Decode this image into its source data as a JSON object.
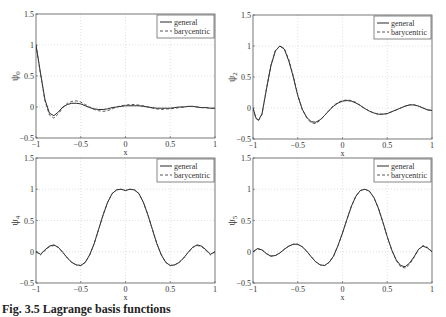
{
  "caption": "Fig. 3.5 Lagrange basis functions",
  "colors": {
    "general": "#111111",
    "barycentric": "#444444",
    "grid": "#cccccc",
    "axes": "#555555"
  },
  "chart_data": [
    {
      "type": "line",
      "id": "psi0",
      "ylabel": "ψ0",
      "ylabel_base": "ψ",
      "ylabel_sub": "0",
      "xlabel": "x",
      "xlim": [
        -1,
        1
      ],
      "ylim": [
        -0.5,
        1.5
      ],
      "xticks": [
        -1,
        -0.5,
        0,
        0.5,
        1
      ],
      "xticklabels": [
        "-1",
        "-0.5",
        "0",
        "0.5",
        "1"
      ],
      "yticks": [
        -0.5,
        0,
        0.5,
        1,
        1.5
      ],
      "yticklabels": [
        "-0.5",
        "0",
        "0.5",
        "1",
        "1.5"
      ],
      "grid": true,
      "legend": {
        "position": "top-right",
        "entries": [
          "general",
          "barycentric"
        ]
      },
      "series": [
        {
          "name": "general",
          "style": "solid",
          "x": [
            -1,
            -0.95,
            -0.9,
            -0.85,
            -0.8,
            -0.75,
            -0.7,
            -0.65,
            -0.6,
            -0.55,
            -0.5,
            -0.45,
            -0.4,
            -0.35,
            -0.3,
            -0.25,
            -0.2,
            -0.15,
            -0.1,
            -0.05,
            0,
            0.05,
            0.1,
            0.15,
            0.2,
            0.25,
            0.3,
            0.35,
            0.4,
            0.45,
            0.5,
            0.55,
            0.6,
            0.65,
            0.7,
            0.75,
            0.8,
            0.85,
            0.9,
            0.95,
            1
          ],
          "y": [
            1.0,
            0.55,
            0.12,
            -0.1,
            -0.14,
            -0.08,
            0.0,
            0.04,
            0.06,
            0.06,
            0.05,
            0.02,
            -0.01,
            -0.03,
            -0.04,
            -0.04,
            -0.03,
            -0.01,
            0.0,
            0.01,
            0.02,
            0.02,
            0.02,
            0.02,
            0.01,
            0.0,
            -0.01,
            -0.02,
            -0.02,
            -0.02,
            -0.02,
            -0.01,
            0.0,
            0.0,
            0.01,
            0.01,
            0.0,
            -0.01,
            -0.01,
            -0.02,
            -0.02
          ]
        },
        {
          "name": "barycentric",
          "style": "dashed",
          "x": [
            -1,
            -0.95,
            -0.9,
            -0.85,
            -0.8,
            -0.75,
            -0.7,
            -0.65,
            -0.6,
            -0.55,
            -0.5,
            -0.45,
            -0.4,
            -0.35,
            -0.3,
            -0.25,
            -0.2,
            -0.15,
            -0.1,
            -0.05,
            0,
            0.05,
            0.1,
            0.15,
            0.2,
            0.25,
            0.3,
            0.35,
            0.4,
            0.45,
            0.5,
            0.55,
            0.6,
            0.65,
            0.7,
            0.75,
            0.8,
            0.85,
            0.9,
            0.95,
            1
          ],
          "y": [
            1.0,
            0.53,
            0.1,
            -0.13,
            -0.18,
            -0.11,
            -0.01,
            0.06,
            0.09,
            0.1,
            0.08,
            0.04,
            0.0,
            -0.04,
            -0.06,
            -0.07,
            -0.06,
            -0.03,
            0.0,
            0.02,
            0.03,
            0.04,
            0.04,
            0.03,
            0.02,
            0.0,
            -0.02,
            -0.03,
            -0.04,
            -0.03,
            -0.03,
            -0.02,
            -0.01,
            0.0,
            0.01,
            0.01,
            0.0,
            -0.01,
            -0.01,
            -0.02,
            -0.02
          ]
        }
      ]
    },
    {
      "type": "line",
      "id": "psi2",
      "ylabel": "ψ2",
      "ylabel_base": "ψ",
      "ylabel_sub": "2",
      "xlabel": "x",
      "xlim": [
        -1,
        1
      ],
      "ylim": [
        -0.5,
        1.5
      ],
      "xticks": [
        -1,
        -0.5,
        0,
        0.5,
        1
      ],
      "xticklabels": [
        "-1",
        "-0.5",
        "0",
        "0.5",
        "1"
      ],
      "yticks": [
        -0.5,
        0,
        0.5,
        1,
        1.5
      ],
      "yticklabels": [
        "-0.5",
        "0",
        "0.5",
        "1",
        "1.5"
      ],
      "grid": true,
      "legend": {
        "position": "top-right",
        "entries": [
          "general",
          "barycentric"
        ]
      },
      "series": [
        {
          "name": "general",
          "style": "solid",
          "x": [
            -1,
            -0.97,
            -0.94,
            -0.9,
            -0.85,
            -0.8,
            -0.75,
            -0.7,
            -0.65,
            -0.6,
            -0.55,
            -0.5,
            -0.45,
            -0.4,
            -0.35,
            -0.3,
            -0.25,
            -0.2,
            -0.15,
            -0.1,
            -0.05,
            0,
            0.05,
            0.1,
            0.15,
            0.2,
            0.25,
            0.3,
            0.35,
            0.4,
            0.45,
            0.5,
            0.55,
            0.6,
            0.65,
            0.7,
            0.75,
            0.8,
            0.85,
            0.9,
            0.95,
            1
          ],
          "y": [
            0.0,
            -0.15,
            -0.2,
            -0.1,
            0.3,
            0.68,
            0.92,
            1.0,
            0.95,
            0.76,
            0.5,
            0.2,
            -0.02,
            -0.15,
            -0.22,
            -0.23,
            -0.19,
            -0.12,
            -0.04,
            0.03,
            0.08,
            0.11,
            0.12,
            0.11,
            0.08,
            0.04,
            -0.01,
            -0.05,
            -0.08,
            -0.1,
            -0.1,
            -0.09,
            -0.06,
            -0.03,
            0.0,
            0.03,
            0.05,
            0.05,
            0.03,
            0.0,
            -0.03,
            -0.04
          ]
        },
        {
          "name": "barycentric",
          "style": "dashed",
          "x": [
            -1,
            -0.97,
            -0.94,
            -0.9,
            -0.85,
            -0.8,
            -0.75,
            -0.7,
            -0.65,
            -0.6,
            -0.55,
            -0.5,
            -0.45,
            -0.4,
            -0.35,
            -0.3,
            -0.25,
            -0.2,
            -0.15,
            -0.1,
            -0.05,
            0,
            0.05,
            0.1,
            0.15,
            0.2,
            0.25,
            0.3,
            0.35,
            0.4,
            0.45,
            0.5,
            0.55,
            0.6,
            0.65,
            0.7,
            0.75,
            0.8,
            0.85,
            0.9,
            0.95,
            1
          ],
          "y": [
            0.0,
            -0.16,
            -0.21,
            -0.1,
            0.31,
            0.69,
            0.93,
            1.0,
            0.96,
            0.78,
            0.52,
            0.21,
            -0.02,
            -0.16,
            -0.24,
            -0.25,
            -0.2,
            -0.12,
            -0.04,
            0.04,
            0.09,
            0.12,
            0.13,
            0.12,
            0.09,
            0.04,
            -0.01,
            -0.05,
            -0.08,
            -0.1,
            -0.1,
            -0.09,
            -0.06,
            -0.03,
            0.0,
            0.03,
            0.05,
            0.05,
            0.03,
            0.0,
            -0.03,
            -0.04
          ]
        }
      ]
    },
    {
      "type": "line",
      "id": "psi4",
      "ylabel": "ψ4",
      "ylabel_base": "ψ",
      "ylabel_sub": "4",
      "xlabel": "x",
      "xlim": [
        -1,
        1
      ],
      "ylim": [
        -0.5,
        1.5
      ],
      "xticks": [
        -1,
        -0.5,
        0,
        0.5,
        1
      ],
      "xticklabels": [
        "-1",
        "-0.5",
        "0",
        "0.5",
        "1"
      ],
      "yticks": [
        -0.5,
        0,
        0.5,
        1,
        1.5
      ],
      "yticklabels": [
        "-0.5",
        "0",
        "0.5",
        "1",
        "1.5"
      ],
      "grid": true,
      "legend": {
        "position": "top-right",
        "entries": [
          "general",
          "barycentric"
        ]
      },
      "series": [
        {
          "name": "general",
          "style": "solid",
          "x": [
            -1,
            -0.95,
            -0.9,
            -0.85,
            -0.8,
            -0.75,
            -0.7,
            -0.65,
            -0.6,
            -0.55,
            -0.5,
            -0.45,
            -0.4,
            -0.35,
            -0.3,
            -0.25,
            -0.2,
            -0.15,
            -0.1,
            -0.05,
            0,
            0.05,
            0.1,
            0.15,
            0.2,
            0.25,
            0.3,
            0.35,
            0.4,
            0.45,
            0.5,
            0.55,
            0.6,
            0.65,
            0.7,
            0.75,
            0.8,
            0.85,
            0.9,
            0.95,
            1
          ],
          "y": [
            0.0,
            -0.04,
            0.03,
            0.09,
            0.11,
            0.07,
            -0.01,
            -0.1,
            -0.17,
            -0.21,
            -0.22,
            -0.17,
            -0.05,
            0.13,
            0.36,
            0.59,
            0.79,
            0.93,
            0.99,
            1.0,
            0.98,
            1.0,
            0.99,
            0.93,
            0.79,
            0.59,
            0.36,
            0.13,
            -0.05,
            -0.17,
            -0.22,
            -0.21,
            -0.17,
            -0.1,
            -0.01,
            0.07,
            0.11,
            0.09,
            0.03,
            -0.04,
            0.0
          ]
        },
        {
          "name": "barycentric",
          "style": "dashed",
          "x": [
            -1,
            -0.95,
            -0.9,
            -0.85,
            -0.8,
            -0.75,
            -0.7,
            -0.65,
            -0.6,
            -0.55,
            -0.5,
            -0.45,
            -0.4,
            -0.35,
            -0.3,
            -0.25,
            -0.2,
            -0.15,
            -0.1,
            -0.05,
            0,
            0.05,
            0.1,
            0.15,
            0.2,
            0.25,
            0.3,
            0.35,
            0.4,
            0.45,
            0.5,
            0.55,
            0.6,
            0.65,
            0.7,
            0.75,
            0.8,
            0.85,
            0.9,
            0.95,
            1
          ],
          "y": [
            0.0,
            -0.05,
            0.02,
            0.08,
            0.1,
            0.07,
            -0.01,
            -0.1,
            -0.17,
            -0.21,
            -0.22,
            -0.17,
            -0.05,
            0.13,
            0.36,
            0.59,
            0.79,
            0.93,
            0.99,
            1.0,
            0.98,
            1.0,
            0.99,
            0.93,
            0.79,
            0.59,
            0.36,
            0.13,
            -0.05,
            -0.17,
            -0.22,
            -0.21,
            -0.17,
            -0.1,
            -0.01,
            0.07,
            0.1,
            0.08,
            0.02,
            -0.05,
            0.0
          ]
        }
      ]
    },
    {
      "type": "line",
      "id": "psi5",
      "ylabel": "ψ5",
      "ylabel_base": "ψ",
      "ylabel_sub": "5",
      "xlabel": "x",
      "xlim": [
        -1,
        1
      ],
      "ylim": [
        -0.5,
        1.5
      ],
      "xticks": [
        -1,
        -0.5,
        0,
        0.5,
        1
      ],
      "xticklabels": [
        "-1",
        "-0.5",
        "0",
        "0.5",
        "1"
      ],
      "yticks": [
        -0.5,
        0,
        0.5,
        1,
        1.5
      ],
      "yticklabels": [
        "-0.5",
        "0",
        "0.5",
        "1",
        "1.5"
      ],
      "grid": true,
      "legend": {
        "position": "top-right",
        "entries": [
          "general",
          "barycentric"
        ]
      },
      "series": [
        {
          "name": "general",
          "style": "solid",
          "x": [
            -1,
            -0.95,
            -0.9,
            -0.85,
            -0.8,
            -0.75,
            -0.7,
            -0.65,
            -0.6,
            -0.55,
            -0.5,
            -0.45,
            -0.4,
            -0.35,
            -0.3,
            -0.25,
            -0.2,
            -0.15,
            -0.1,
            -0.05,
            0,
            0.05,
            0.1,
            0.15,
            0.2,
            0.25,
            0.3,
            0.35,
            0.4,
            0.45,
            0.5,
            0.55,
            0.6,
            0.65,
            0.7,
            0.75,
            0.8,
            0.85,
            0.9,
            0.95,
            1
          ],
          "y": [
            0.0,
            0.05,
            0.03,
            -0.03,
            -0.07,
            -0.06,
            -0.02,
            0.04,
            0.09,
            0.12,
            0.12,
            0.08,
            0.01,
            -0.08,
            -0.16,
            -0.21,
            -0.22,
            -0.17,
            -0.07,
            0.1,
            0.3,
            0.52,
            0.73,
            0.89,
            0.98,
            1.0,
            0.97,
            0.87,
            0.7,
            0.48,
            0.24,
            0.03,
            -0.13,
            -0.22,
            -0.24,
            -0.18,
            -0.08,
            0.04,
            0.09,
            0.06,
            0.0
          ]
        },
        {
          "name": "barycentric",
          "style": "dashed",
          "x": [
            -1,
            -0.95,
            -0.9,
            -0.85,
            -0.8,
            -0.75,
            -0.7,
            -0.65,
            -0.6,
            -0.55,
            -0.5,
            -0.45,
            -0.4,
            -0.35,
            -0.3,
            -0.25,
            -0.2,
            -0.15,
            -0.1,
            -0.05,
            0,
            0.05,
            0.1,
            0.15,
            0.2,
            0.25,
            0.3,
            0.35,
            0.4,
            0.45,
            0.5,
            0.55,
            0.6,
            0.65,
            0.7,
            0.75,
            0.8,
            0.85,
            0.9,
            0.95,
            1
          ],
          "y": [
            0.0,
            0.05,
            0.03,
            -0.03,
            -0.07,
            -0.06,
            -0.02,
            0.04,
            0.09,
            0.12,
            0.12,
            0.08,
            0.01,
            -0.08,
            -0.16,
            -0.21,
            -0.22,
            -0.17,
            -0.07,
            0.1,
            0.3,
            0.52,
            0.73,
            0.89,
            0.98,
            1.0,
            0.97,
            0.87,
            0.7,
            0.48,
            0.24,
            0.03,
            -0.14,
            -0.24,
            -0.26,
            -0.2,
            -0.09,
            0.04,
            0.1,
            0.07,
            0.0
          ]
        }
      ]
    }
  ],
  "panels": [
    {
      "left": 36,
      "top": 14,
      "width": 179,
      "height": 124
    },
    {
      "left": 253,
      "top": 15,
      "width": 179,
      "height": 124
    },
    {
      "left": 36,
      "top": 158,
      "width": 179,
      "height": 125
    },
    {
      "left": 253,
      "top": 158,
      "width": 179,
      "height": 125
    }
  ]
}
